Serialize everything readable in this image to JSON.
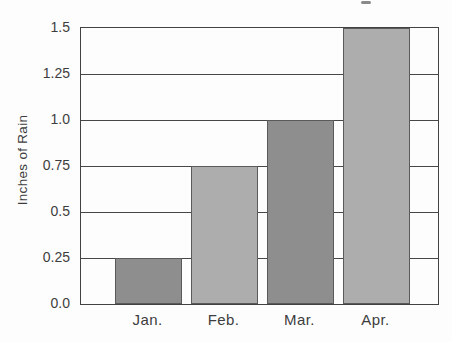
{
  "chart_data": {
    "type": "bar",
    "title": "",
    "ylabel": "Inches of Rain",
    "xlabel": "",
    "categories": [
      "Jan.",
      "Feb.",
      "Mar.",
      "Apr."
    ],
    "values": [
      0.25,
      0.75,
      1.0,
      1.5
    ],
    "bar_colors": [
      "#8e8e8e",
      "#adadad",
      "#8e8e8e",
      "#adadad"
    ],
    "bar_border_color": "#5a5a5a",
    "ytick_labels": [
      "0.0",
      "0.25",
      "0.5",
      "0.75",
      "1.0",
      "1.25",
      "1.5"
    ],
    "yticks": [
      0,
      0.25,
      0.5,
      0.75,
      1.0,
      1.25,
      1.5
    ],
    "ylim": [
      0,
      1.5
    ],
    "grid": true,
    "grid_color": "#474747",
    "frame_color": "#424242",
    "text_color": "#3d3d3d",
    "legend_position": "none",
    "background_color": "#fdfdfd"
  }
}
